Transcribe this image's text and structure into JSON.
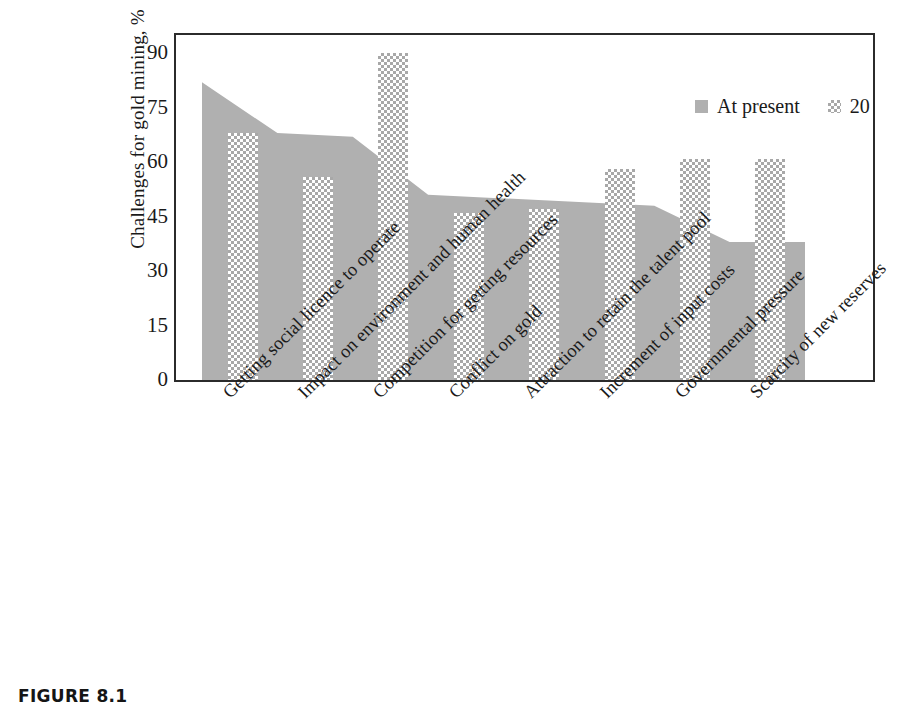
{
  "caption": "FIGURE 8.1",
  "colors": {
    "at_present_fill": "#b0b0b0",
    "later_pattern": "#a8a8a8",
    "axis": "#2b2b2b",
    "text": "#1a1a1a",
    "background": "#ffffff"
  },
  "legend": {
    "position": "top-right-inside",
    "entries": [
      {
        "label": "At present",
        "swatch": "solid-gray-square"
      },
      {
        "label": "20 years later",
        "swatch": "checkered-square"
      }
    ]
  },
  "chart_data": {
    "type": "bar",
    "title": "",
    "subtitle": "",
    "xlabel": "",
    "ylabel": "Challenges for gold mining, %",
    "ylim": [
      0,
      95
    ],
    "yticks": [
      0,
      15,
      30,
      45,
      60,
      75,
      90
    ],
    "ytick_labels": [
      "0",
      "15",
      "30",
      "45",
      "60",
      "75",
      "90"
    ],
    "grid": false,
    "legend_position": "top right",
    "categories": [
      "Getting social licence to operate",
      "Impact on environment and human health",
      "Competition for getting resources",
      "Conflict on gold",
      "Attraction to retain the talent pool",
      "Increment of input costs",
      "Governmental pressure",
      "Scarcity of new reserves"
    ],
    "series": [
      {
        "name": "At present",
        "style": "solid",
        "values": [
          82,
          68,
          67,
          51,
          50,
          49,
          48,
          38
        ]
      },
      {
        "name": "20 years later",
        "style": "checkered",
        "values": [
          68,
          56,
          90,
          46,
          47,
          58,
          61,
          61
        ]
      }
    ]
  }
}
